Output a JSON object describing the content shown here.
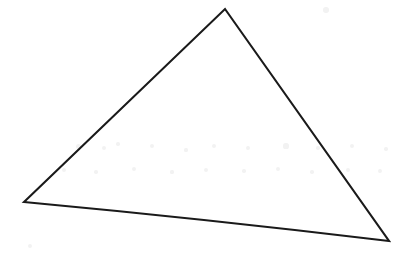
{
  "canvas": {
    "width": 412,
    "height": 256,
    "background_color": "#ffffff",
    "description": "Scanned line drawing of a single scalene triangle outline"
  },
  "figure": {
    "name": "triangle",
    "shape_type": "triangle",
    "stroke_color": "#1a1a1a",
    "fill_color": "none",
    "stroke_width": 2.1,
    "vertices": [
      {
        "label": "apex",
        "x": 225,
        "y": 9
      },
      {
        "label": "bottom-right",
        "x": 389,
        "y": 241
      },
      {
        "label": "bottom-left",
        "x": 24,
        "y": 202
      }
    ],
    "edges": [
      {
        "label": "left-edge",
        "from": "bottom-left",
        "to": "apex",
        "path": "M 24 202 L 225 9"
      },
      {
        "label": "right-edge",
        "from": "apex",
        "to": "bottom-right",
        "path": "M 225 9 L 389 241"
      },
      {
        "label": "bottom-edge",
        "from": "bottom-right",
        "to": "bottom-left",
        "path": "M 389 241 Q 206 219 24 202",
        "note": "slightly bowed upward"
      }
    ],
    "outline_path": "M 24 202 L 225 9 L 389 241 Q 206 219 24 202 Z"
  },
  "artifacts": {
    "name": "scan-noise",
    "color": "#f2f2f2",
    "specks": [
      {
        "x": 78,
        "y": 146,
        "r": 2.5
      },
      {
        "x": 104,
        "y": 148,
        "r": 2.0
      },
      {
        "x": 118,
        "y": 144,
        "r": 1.8
      },
      {
        "x": 152,
        "y": 146,
        "r": 2.2
      },
      {
        "x": 186,
        "y": 150,
        "r": 1.6
      },
      {
        "x": 214,
        "y": 146,
        "r": 2.4
      },
      {
        "x": 248,
        "y": 148,
        "r": 1.9
      },
      {
        "x": 286,
        "y": 146,
        "r": 2.6
      },
      {
        "x": 318,
        "y": 148,
        "r": 1.7
      },
      {
        "x": 352,
        "y": 146,
        "r": 2.1
      },
      {
        "x": 386,
        "y": 149,
        "r": 1.8
      },
      {
        "x": 64,
        "y": 170,
        "r": 2.0
      },
      {
        "x": 96,
        "y": 172,
        "r": 1.7
      },
      {
        "x": 134,
        "y": 169,
        "r": 2.3
      },
      {
        "x": 172,
        "y": 172,
        "r": 1.6
      },
      {
        "x": 206,
        "y": 170,
        "r": 2.0
      },
      {
        "x": 244,
        "y": 171,
        "r": 1.8
      },
      {
        "x": 278,
        "y": 169,
        "r": 2.2
      },
      {
        "x": 312,
        "y": 172,
        "r": 1.7
      },
      {
        "x": 348,
        "y": 170,
        "r": 2.0
      },
      {
        "x": 380,
        "y": 171,
        "r": 1.9
      },
      {
        "x": 326,
        "y": 10,
        "r": 2.8
      },
      {
        "x": 30,
        "y": 246,
        "r": 2.0
      }
    ]
  }
}
